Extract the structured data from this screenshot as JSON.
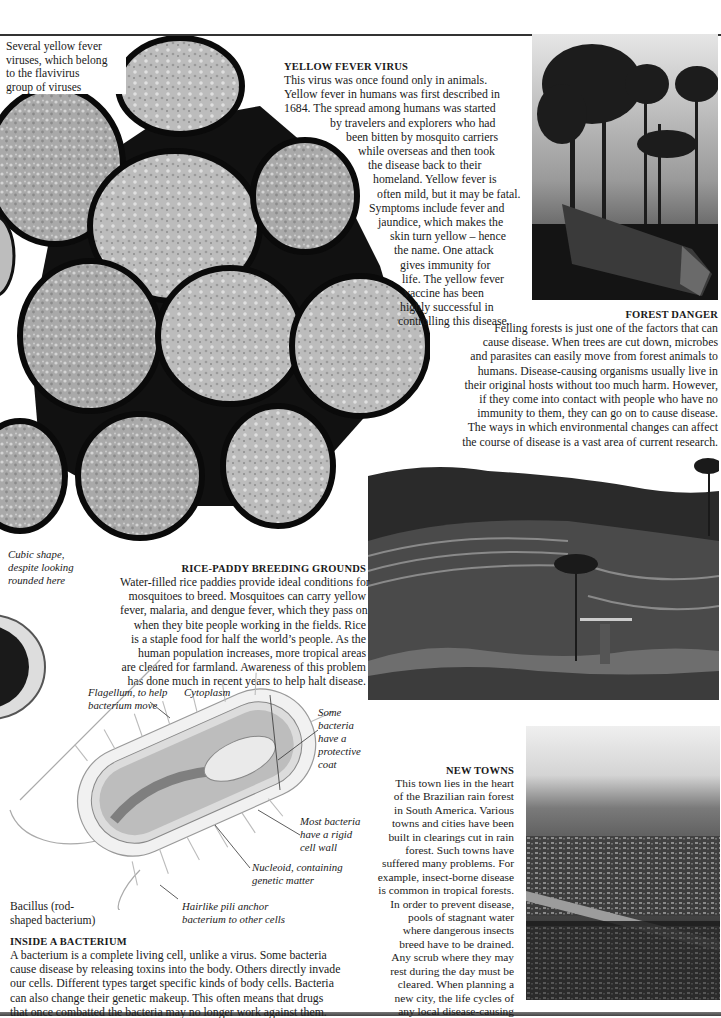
{
  "page": {
    "accent_rule_color": "#333333"
  },
  "virus_figure": {
    "caption": [
      "Several yellow fever",
      "viruses, which belong",
      "to the flavivirus",
      "group of viruses"
    ],
    "annotation": [
      "Cubic shape,",
      "despite looking",
      "rounded here"
    ],
    "icon": "virus-cluster-illustration"
  },
  "yellow_fever": {
    "heading": "YELLOW FEVER VIRUS",
    "lines": [
      "This virus was once found only in animals.",
      "Yellow fever in humans was first described in",
      "1684. The spread among humans was started",
      "by travelers and explorers who had",
      "been bitten by mosquito carriers",
      "while overseas and then took",
      "the disease back to their",
      "homeland. Yellow fever is",
      "often mild, but it may be fatal.",
      "Symptoms include fever and",
      "jaundice, which makes the",
      "skin turn yellow – hence",
      "the name. One attack",
      "gives immunity for",
      "life. The yellow fever",
      "vaccine has been",
      "highly successful in",
      "controlling this disease."
    ]
  },
  "forest_danger": {
    "heading": "FOREST DANGER",
    "photo": "felled-forest-photo",
    "lines": [
      "Felling forests is just one of the factors that can",
      "cause disease. When trees are cut down, microbes",
      "and parasites can easily move from forest animals to",
      "humans. Disease-causing organisms usually live in",
      "their original hosts without too much harm. However,",
      "if they come into contact with people who have no",
      "immunity to them, they can go on to cause disease.",
      "The ways in which environmental changes can affect",
      "the course of disease is a vast area of current research."
    ]
  },
  "rice_paddy": {
    "heading": "RICE-PADDY BREEDING GROUNDS",
    "photo": "rice-terraces-photo",
    "lines": [
      "Water-filled rice paddies provide ideal conditions for",
      "mosquitoes to breed. Mosquitoes can carry yellow",
      "fever, malaria, and dengue fever, which they pass on",
      "when they bite people working in the fields. Rice",
      "is a staple food for half the world’s people. As the",
      "human population increases, more tropical areas",
      "are cleared for farmland. Awareness of this problem",
      "has done much in recent years to help halt disease."
    ]
  },
  "bacterium_figure": {
    "labels": {
      "flagellum": [
        "Flagellum, to help",
        "bacterium move"
      ],
      "cytoplasm": [
        "Cytoplasm"
      ],
      "protective_coat": [
        "Some",
        "bacteria",
        "have a",
        "protective",
        "coat"
      ],
      "cell_wall": [
        "Most bacteria",
        "have a rigid",
        "cell wall"
      ],
      "nucleoid": [
        "Nucleoid, containing",
        "genetic matter"
      ],
      "pili": [
        "Hairlike pili anchor",
        "bacterium to other cells"
      ],
      "bacillus": [
        "Bacillus (rod-",
        "shaped bacterium)"
      ]
    }
  },
  "inside_bacterium": {
    "heading": "INSIDE A BACTERIUM",
    "lines": [
      "A bacterium is a complete living cell, unlike a virus. Some bacteria",
      "cause disease by releasing toxins into the body. Others directly invade",
      "our cells. Different types target specific kinds of body cells. Bacteria",
      "can also change their genetic makeup. This often means that drugs",
      "that once combatted the bacteria may no longer work against them."
    ]
  },
  "new_towns": {
    "heading": "NEW TOWNS",
    "photo": "rainforest-town-aerial-photo",
    "lines": [
      "This town lies in the heart",
      "of the Brazilian rain forest",
      "in South America. Various",
      "towns and cities have been",
      "built in clearings cut in rain",
      "forest. Such towns have",
      "suffered many problems. For",
      "example, insect-borne disease",
      "is common in tropical forests.",
      "In order to prevent disease,",
      "pools of stagnant water",
      "where dangerous insects",
      "breed have to be drained.",
      "Any scrub where they may",
      "rest during the day must be",
      "cleared. When planning a",
      "new city, the life cycles of",
      "any local disease-causing",
      "insects must be considered."
    ]
  }
}
